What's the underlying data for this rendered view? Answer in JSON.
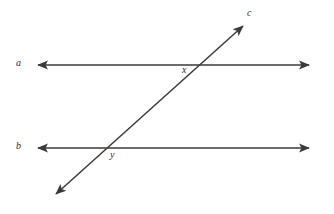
{
  "diagram": {
    "kind": "geometry-figure",
    "background_color": "#ffffff",
    "stroke_color": "#3a3a3a",
    "label_color": "#2b2b2b",
    "canvas": {
      "width": 334,
      "height": 214
    },
    "labels": {
      "line_a": "a",
      "line_b": "b",
      "line_c": "c",
      "point_x": "x",
      "point_y": "y"
    },
    "elements": {
      "line_a": {
        "name": "a",
        "type": "double-headed-arrow",
        "orientation": "horizontal",
        "x1": 35,
        "y1": 65,
        "x2": 312,
        "y2": 65
      },
      "line_b": {
        "name": "b",
        "type": "double-headed-arrow",
        "orientation": "horizontal",
        "x1": 35,
        "y1": 148,
        "x2": 312,
        "y2": 148
      },
      "line_c": {
        "name": "c",
        "type": "double-headed-arrow",
        "orientation": "transversal",
        "x1": 53,
        "y1": 197,
        "x2": 246,
        "y2": 23
      }
    },
    "intersections": [
      {
        "label": "x",
        "of": [
          "a",
          "c"
        ],
        "cx": 192,
        "cy": 65
      },
      {
        "label": "y",
        "of": [
          "b",
          "c"
        ],
        "cx": 106,
        "cy": 148
      }
    ]
  }
}
